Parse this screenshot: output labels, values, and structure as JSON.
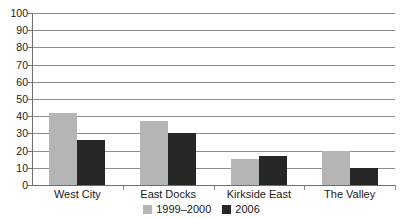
{
  "chart_data": {
    "type": "bar",
    "title": "",
    "xlabel": "",
    "ylabel": "",
    "categories": [
      "West City",
      "East Docks",
      "Kirkside East",
      "The Valley"
    ],
    "series": [
      {
        "name": "1999–2000",
        "color": "#b5b5b5",
        "values": [
          42,
          37,
          15,
          20
        ]
      },
      {
        "name": "2006",
        "color": "#262626",
        "values": [
          26,
          30,
          17,
          10
        ]
      }
    ],
    "ylim": [
      0,
      100
    ],
    "yticks": [
      0,
      10,
      20,
      30,
      40,
      50,
      60,
      70,
      80,
      90,
      100
    ],
    "ytick_labels": [
      "0",
      "10",
      "20",
      "30",
      "40",
      "50",
      "60",
      "70",
      "80",
      "90",
      "100"
    ],
    "grid": true,
    "grid_axis": "y",
    "legend_position": "bottom-center",
    "axis_color": "#6e6e6e",
    "grid_color": "#8c8c8c",
    "background": "#ffffff"
  }
}
